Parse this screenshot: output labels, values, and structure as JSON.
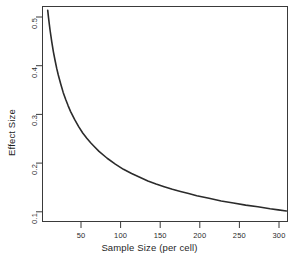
{
  "chart_data": {
    "type": "line",
    "title": "",
    "xlabel": "Sample Size (per cell)",
    "ylabel": "Effect Size",
    "xlim": [
      10,
      312
    ],
    "ylim": [
      0.095,
      0.505
    ],
    "xticks": [
      50,
      100,
      150,
      200,
      250,
      300
    ],
    "xtick_labels": [
      "50",
      "100",
      "150",
      "200",
      "250",
      "300"
    ],
    "yticks": [
      0.1,
      0.2,
      0.3,
      0.4,
      0.5
    ],
    "ytick_labels": [
      "0.1",
      "0.2",
      "0.3",
      "0.4",
      "0.5"
    ],
    "grid": false,
    "legend": null,
    "line_color": "#2b2b2b",
    "line_width": 1.6,
    "annotations": [],
    "series": [
      {
        "name": "Required effect size (power curve)",
        "x": [
          17,
          18,
          19,
          20,
          22,
          24,
          26,
          28,
          30,
          33,
          36,
          39,
          42,
          45,
          50,
          55,
          60,
          65,
          70,
          75,
          80,
          90,
          100,
          110,
          120,
          130,
          140,
          150,
          160,
          170,
          180,
          190,
          200,
          215,
          230,
          245,
          260,
          275,
          290,
          300,
          310
        ],
        "y": [
          0.497,
          0.483,
          0.47,
          0.458,
          0.437,
          0.418,
          0.402,
          0.387,
          0.374,
          0.357,
          0.341,
          0.328,
          0.316,
          0.305,
          0.29,
          0.276,
          0.264,
          0.254,
          0.245,
          0.237,
          0.229,
          0.216,
          0.205,
          0.195,
          0.187,
          0.18,
          0.173,
          0.167,
          0.162,
          0.157,
          0.153,
          0.149,
          0.145,
          0.14,
          0.135,
          0.131,
          0.127,
          0.124,
          0.12,
          0.118,
          0.116
        ]
      }
    ]
  },
  "axes": {
    "x_title": "Sample Size (per cell)",
    "y_title": "Effect Size"
  }
}
